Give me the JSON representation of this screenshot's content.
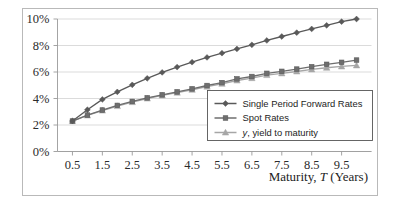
{
  "chart_data": {
    "type": "line",
    "title": "",
    "xlabel_prefix": "Maturity, ",
    "xlabel_symbol": "T",
    "xlabel_suffix": " (Years)",
    "ylabel": "",
    "xlim": [
      0,
      10.5
    ],
    "ylim": [
      0,
      0.1
    ],
    "grid": true,
    "legend_position": "inside-lower-right",
    "x": [
      0.5,
      1.0,
      1.5,
      2.0,
      2.5,
      3.0,
      3.5,
      4.0,
      4.5,
      5.0,
      5.5,
      6.0,
      6.5,
      7.0,
      7.5,
      8.0,
      8.5,
      9.0,
      9.5,
      10.0
    ],
    "xticks": [
      0.5,
      1.5,
      2.5,
      3.5,
      4.5,
      5.5,
      6.5,
      7.5,
      8.5,
      9.5
    ],
    "xticklabels": [
      "0.5",
      "1.5",
      "2.5",
      "3.5",
      "4.5",
      "5.5",
      "6.5",
      "7.5",
      "8.5",
      "9.5"
    ],
    "yticks": [
      0,
      0.02,
      0.04,
      0.06,
      0.08,
      0.1
    ],
    "yticklabels": [
      "0%",
      "2%",
      "4%",
      "6%",
      "8%",
      "10%"
    ],
    "series": [
      {
        "name": "Single Period Forward Rates",
        "marker": "diamond",
        "color": "#595959",
        "values": [
          0.023,
          0.0315,
          0.0393,
          0.045,
          0.0503,
          0.0552,
          0.0597,
          0.0637,
          0.0674,
          0.071,
          0.0742,
          0.0774,
          0.0805,
          0.0838,
          0.0868,
          0.0897,
          0.0925,
          0.0952,
          0.098,
          0.1
        ]
      },
      {
        "name": "Spot Rates",
        "marker": "square",
        "color": "#6e6e6e",
        "values": [
          0.023,
          0.0275,
          0.0313,
          0.0348,
          0.0378,
          0.0405,
          0.0428,
          0.045,
          0.0473,
          0.0498,
          0.052,
          0.0548,
          0.0566,
          0.059,
          0.0605,
          0.0622,
          0.064,
          0.0658,
          0.0673,
          0.069
        ]
      },
      {
        "name": "y, yield to maturity",
        "label_symbol": "y",
        "label_rest": ", yield to maturity",
        "marker": "triangle",
        "color": "#a6a6a6",
        "values": [
          0.023,
          0.0272,
          0.0309,
          0.0343,
          0.0373,
          0.04,
          0.0423,
          0.0444,
          0.0466,
          0.049,
          0.0511,
          0.0536,
          0.0554,
          0.0577,
          0.059,
          0.0604,
          0.062,
          0.0632,
          0.0642,
          0.065
        ]
      }
    ]
  },
  "legend": {
    "entries": [
      {
        "label": "Single Period Forward Rates"
      },
      {
        "label": "Spot Rates"
      },
      {
        "label": ", yield to maturity",
        "symbol": "y"
      }
    ]
  },
  "colors": {
    "forward": "#595959",
    "spot": "#6e6e6e",
    "yield": "#a6a6a6",
    "grid": "#d2d2d2",
    "axis": "#9a9a9a",
    "frame": "#b9b9b9",
    "text": "#1d1d1d"
  }
}
